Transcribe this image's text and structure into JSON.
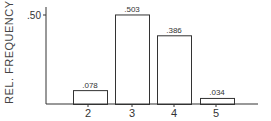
{
  "chart_data": {
    "type": "bar",
    "title": "",
    "xlabel": "",
    "ylabel": "REL. FREQUENCY",
    "categories": [
      "2",
      "3",
      "4",
      "5"
    ],
    "values": [
      0.078,
      0.503,
      0.386,
      0.034
    ],
    "value_labels": [
      ".078",
      ".503",
      ".386",
      ".034"
    ],
    "yticks": [
      {
        "value": 0.5,
        "label": ".50"
      }
    ],
    "ylim": [
      0,
      0.6
    ],
    "grid": false,
    "legend": null
  },
  "colors": {
    "ink": "#333333",
    "background": "#ffffff"
  }
}
